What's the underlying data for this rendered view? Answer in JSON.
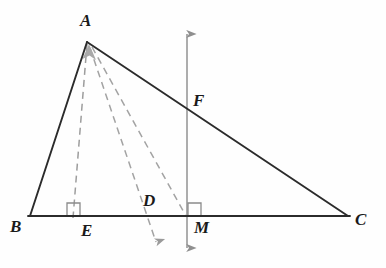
{
  "figure": {
    "background_color": "#fefefe",
    "stroke_color": "#2b2b2b",
    "dashed_color": "#9a9a9a",
    "vertical_line_color": "#8a8a8a",
    "right_angle_color": "#8a8a8a",
    "label_color": "#1a1a1a"
  },
  "labels": {
    "A": "A",
    "B": "B",
    "C": "C",
    "D": "D",
    "E": "E",
    "F": "F",
    "M": "M"
  },
  "points": {
    "A": {
      "x": 87,
      "y": 42
    },
    "B": {
      "x": 30,
      "y": 216
    },
    "C": {
      "x": 348,
      "y": 216
    },
    "D": {
      "x": 150,
      "y": 216
    },
    "E": {
      "x": 73,
      "y": 216
    },
    "F": {
      "x": 187,
      "y": 110
    },
    "M": {
      "x": 187,
      "y": 216
    }
  },
  "label_positions": {
    "A": {
      "x": 80,
      "y": 12
    },
    "B": {
      "x": 10,
      "y": 218
    },
    "C": {
      "x": 355,
      "y": 212
    },
    "D": {
      "x": 143,
      "y": 193
    },
    "E": {
      "x": 81,
      "y": 222
    },
    "F": {
      "x": 192,
      "y": 92
    },
    "M": {
      "x": 193,
      "y": 220
    }
  },
  "segments": [
    {
      "name": "side-AB",
      "from": "A",
      "to": "B",
      "style": "solid"
    },
    {
      "name": "side-AC",
      "from": "A",
      "to": "C",
      "style": "solid"
    },
    {
      "name": "side-BC",
      "from": "B",
      "to": "C",
      "style": "solid"
    },
    {
      "name": "altitude-AE",
      "from": "A",
      "to": "E",
      "style": "dashed"
    },
    {
      "name": "cevian-AD",
      "from": "A",
      "to": "D",
      "style": "dashed"
    },
    {
      "name": "median-AM",
      "from": "A",
      "to": "M",
      "style": "dashed"
    }
  ],
  "arrows": {
    "vertical_line": {
      "name": "vertical-line-through-M",
      "top": {
        "x": 187,
        "y": 27
      },
      "bottom": {
        "x": 187,
        "y": 255
      },
      "double_headed": true
    },
    "dashed_arrow_down": {
      "name": "dashed-ray-arrowhead-down",
      "tip": {
        "x": 158,
        "y": 250
      }
    },
    "dashed_arrow_up_to_A": {
      "name": "dashed-ray-arrowhead-up-to-A",
      "tip": {
        "x": 88,
        "y": 45
      }
    }
  },
  "right_angles": [
    {
      "name": "right-angle-at-E",
      "x": 67,
      "y": 203,
      "size": 13
    },
    {
      "name": "right-angle-at-M",
      "x": 188,
      "y": 203,
      "size": 13
    }
  ]
}
